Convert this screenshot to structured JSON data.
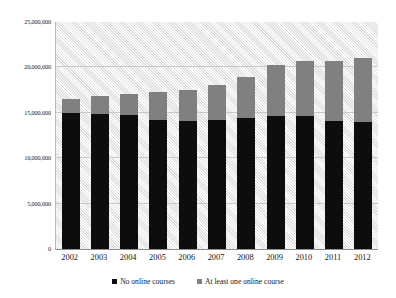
{
  "chart_data": {
    "type": "bar",
    "subtype": "stacked-column",
    "title": "",
    "subtitle": "",
    "xlabel": "",
    "ylabel": "",
    "categories": [
      "2002",
      "2003",
      "2004",
      "2005",
      "2006",
      "2007",
      "2008",
      "2009",
      "2010",
      "2011",
      "2012"
    ],
    "series": [
      {
        "name": "No online courses",
        "color": "#0d0d0d",
        "values": [
          14950000,
          14850000,
          14800000,
          14250000,
          14150000,
          14200000,
          14450000,
          14700000,
          14700000,
          14100000,
          13950000
        ]
      },
      {
        "name": "At least one online course",
        "color": "#808080",
        "values": [
          1600000,
          1950000,
          2300000,
          3050000,
          3400000,
          3900000,
          4450000,
          5600000,
          6050000,
          6650000,
          7050000
        ]
      }
    ],
    "totals": [
      16550000,
      16800000,
      17100000,
      17300000,
      17550000,
      18100000,
      18900000,
      20300000,
      20750000,
      20750000,
      21000000
    ],
    "ylim": [
      0,
      25000000
    ],
    "y_ticks": [
      0,
      5000000,
      10000000,
      15000000,
      20000000,
      25000000
    ],
    "y_tick_labels": [
      "0",
      "5,000,000",
      "10,000,000",
      "15,000,000",
      "20,000,000",
      "25,000,000"
    ],
    "grid": true,
    "grid_axis": "y",
    "legend_position": "bottom",
    "plot_background": "hatched-light-gray"
  },
  "legend": {
    "entries": [
      {
        "label": "No online courses",
        "color": "#0d0d0d"
      },
      {
        "label": "At least one online course",
        "color": "#808080"
      }
    ]
  }
}
